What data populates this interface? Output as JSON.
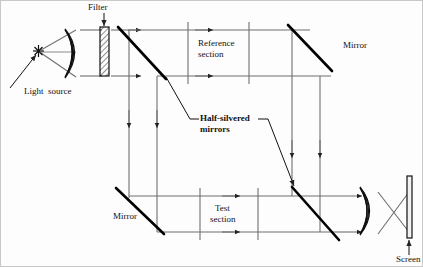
{
  "figure": {
    "type": "optical-ray-diagram",
    "name": "Mach-Zehnder interferometer schematic",
    "width": 423,
    "height": 267,
    "background": "#fdfdfd",
    "line_color": "#6f6f6f",
    "bold_color": "#000000",
    "text_color": "#111111"
  },
  "labels": {
    "filter": "Filter",
    "light_source": "Light  source",
    "reference_section_line1": "Reference",
    "reference_section_line2": "section",
    "mirror_top": "Mirror",
    "half_silvered_line1": "Half-silvered",
    "half_silvered_line2": "mirrors",
    "mirror_bottom": "Mirror",
    "test_section_line1": "Test",
    "test_section_line2": "section",
    "screen": "Screen"
  },
  "components": [
    {
      "name": "light-source",
      "kind": "star-emitter",
      "x": 38,
      "y": 51
    },
    {
      "name": "collimating-lens",
      "kind": "biconvex-lens-hatched",
      "x": 72,
      "y": 53,
      "w": 19,
      "h": 50
    },
    {
      "name": "filter",
      "kind": "hatched-plate",
      "x": 102,
      "y": 51,
      "w": 9,
      "h": 47
    },
    {
      "name": "beamsplitter-upper-left",
      "kind": "half-silvered-mirror",
      "x1": 118,
      "y1": 28,
      "x2": 166,
      "y2": 79
    },
    {
      "name": "mirror-upper-right",
      "kind": "mirror",
      "x1": 288,
      "y1": 26,
      "x2": 331,
      "y2": 71
    },
    {
      "name": "mirror-lower-left",
      "kind": "mirror",
      "x1": 117,
      "y1": 189,
      "x2": 164,
      "y2": 233
    },
    {
      "name": "beamsplitter-lower-right",
      "kind": "half-silvered-mirror",
      "x1": 292,
      "y1": 188,
      "x2": 338,
      "y2": 239
    },
    {
      "name": "focusing-lens",
      "kind": "biconvex-lens-hatched",
      "x": 366,
      "y": 210,
      "w": 17,
      "h": 48
    },
    {
      "name": "screen",
      "kind": "vertical-plate",
      "x": 409,
      "y": 206,
      "w": 6,
      "h": 62
    }
  ],
  "beams": {
    "top_rays_y": [
      36,
      71
    ],
    "bottom_rays_y": [
      196,
      231
    ],
    "vertical_left_x": [
      129,
      157
    ],
    "vertical_right_x": [
      292,
      320
    ],
    "reference_section_bounds_x": [
      188,
      249
    ],
    "test_section_bounds_x": [
      200,
      258
    ]
  }
}
